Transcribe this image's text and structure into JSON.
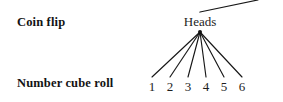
{
  "diagram": {
    "type": "probability-tree-fragment",
    "background_color": "#ffffff",
    "ink_color": "#171717",
    "rows": [
      {
        "id": "coin-flip",
        "label": "Coin flip"
      },
      {
        "id": "number-cube-roll",
        "label": "Number cube roll"
      }
    ],
    "parent_edge": {
      "description": "partial edge entering from upper right, cropped at image edge",
      "x1": 200,
      "y1": 12,
      "x2": 258,
      "y2": 0
    },
    "branch_node": {
      "label": "Heads",
      "label_x": 200,
      "label_y": 14,
      "point_x": 200,
      "point_y": 32,
      "dot_radius": 2.0
    },
    "leaves": [
      {
        "label": "1",
        "x": 152
      },
      {
        "label": "2",
        "x": 170
      },
      {
        "label": "3",
        "x": 188
      },
      {
        "label": "4",
        "x": 206
      },
      {
        "label": "5",
        "x": 224
      },
      {
        "label": "6",
        "x": 242
      }
    ],
    "leaf_label_y": 79,
    "edge_bottom_y": 77
  }
}
